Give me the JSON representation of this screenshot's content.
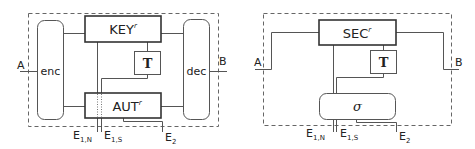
{
  "left_diagram": {
    "port_left": "A",
    "port_right": "B",
    "encoder_label": "enc",
    "decoder_label": "dec",
    "key_box": {
      "label": "KEY",
      "superscript": "r"
    },
    "auth_box": {
      "label": "AUT",
      "superscript": "r"
    },
    "t_box": {
      "label": "T"
    },
    "eve_ports": [
      {
        "label": "E",
        "sub": "1,N"
      },
      {
        "label": "E",
        "sub": "1,S"
      },
      {
        "label": "E",
        "sub": "2"
      }
    ]
  },
  "right_diagram": {
    "port_left": "A",
    "port_right": "B",
    "sec_box": {
      "label": "SEC",
      "superscript": "r"
    },
    "t_box": {
      "label": "T"
    },
    "simulator_label": "σ",
    "eve_ports": [
      {
        "label": "E",
        "sub": "1,N"
      },
      {
        "label": "E",
        "sub": "1,S"
      },
      {
        "label": "E",
        "sub": "2"
      }
    ]
  },
  "colors": {
    "line": "#444444",
    "dash": "#666666",
    "text": "#222222"
  }
}
